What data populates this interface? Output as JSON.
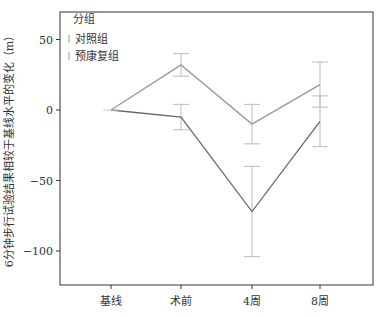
{
  "chart_data": {
    "type": "line",
    "title": "",
    "xlabel": "",
    "ylabel": "6分钟步行试验结果相较于基线水平的变化（m）",
    "categories": [
      "基线",
      "术前",
      "4周",
      "8周"
    ],
    "ylim": [
      -125,
      68
    ],
    "yticks": [
      50,
      0,
      -50,
      -100
    ],
    "legend": {
      "title": "分组",
      "position": "top-left"
    },
    "series": [
      {
        "name": "对照组",
        "color": "#9a9a9a",
        "values": [
          0,
          32,
          -10,
          18
        ],
        "err_upper": [
          0,
          40,
          4,
          34
        ],
        "err_lower": [
          0,
          24,
          -24,
          2
        ]
      },
      {
        "name": "预康复组",
        "color": "#666666",
        "values": [
          0,
          -5,
          -72,
          -8
        ],
        "err_upper": [
          0,
          4,
          -40,
          10
        ],
        "err_lower": [
          0,
          -14,
          -104,
          -26
        ]
      }
    ]
  }
}
